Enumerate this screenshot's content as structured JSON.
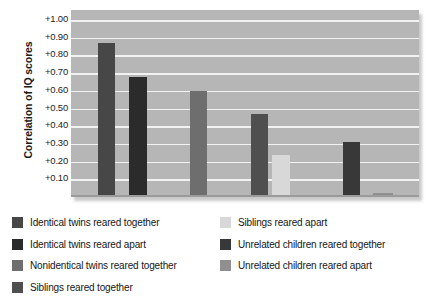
{
  "chart_data": {
    "type": "bar",
    "title": "",
    "xlabel": "",
    "ylabel": "Correlation of IQ scores",
    "ylim": [
      0,
      1.0
    ],
    "grid": true,
    "legend_position": "bottom",
    "ytick_labels": [
      "+1.00",
      "+0.90",
      "+0.80",
      "+0.70",
      "+0.60",
      "+0.50",
      "+0.40",
      "+0.30",
      "+0.20",
      "+0.10"
    ],
    "ytick_values": [
      1.0,
      0.9,
      0.8,
      0.7,
      0.6,
      0.5,
      0.4,
      0.3,
      0.2,
      0.1
    ],
    "categories": [
      "Identical twins reared together",
      "Identical twins reared apart",
      "Nonidentical twins reared together",
      "Siblings reared together",
      "Siblings reared apart",
      "Unrelated children reared together",
      "Unrelated children reared apart"
    ],
    "values": [
      0.87,
      0.68,
      0.6,
      0.47,
      0.24,
      0.31,
      0.02
    ],
    "colors": [
      "#474747",
      "#2b2b2b",
      "#6e6e6e",
      "#4f4f4f",
      "#d8d8d8",
      "#383838",
      "#8f8f8f"
    ]
  },
  "axis": {
    "ylabel": "Correlation of IQ scores",
    "ticks": [
      {
        "label": "+1.00",
        "value": 1.0
      },
      {
        "label": "+0.90",
        "value": 0.9
      },
      {
        "label": "+0.80",
        "value": 0.8
      },
      {
        "label": "+0.70",
        "value": 0.7
      },
      {
        "label": "+0.60",
        "value": 0.6
      },
      {
        "label": "+0.50",
        "value": 0.5
      },
      {
        "label": "+0.40",
        "value": 0.4
      },
      {
        "label": "+0.30",
        "value": 0.3
      },
      {
        "label": "+0.20",
        "value": 0.2
      },
      {
        "label": "+0.10",
        "value": 0.1
      }
    ]
  },
  "legend": {
    "left_column": [
      {
        "label": "Identical twins reared together",
        "color": "#474747"
      },
      {
        "label": "Identical twins reared apart",
        "color": "#2b2b2b"
      },
      {
        "label": "Nonidentical twins reared together",
        "color": "#6e6e6e"
      },
      {
        "label": "Siblings reared together",
        "color": "#4f4f4f"
      }
    ],
    "right_column": [
      {
        "label": "Siblings reared apart",
        "color": "#d8d8d8"
      },
      {
        "label": "Unrelated children reared together",
        "color": "#383838"
      },
      {
        "label": "Unrelated children reared apart",
        "color": "#8f8f8f"
      }
    ]
  },
  "style": {
    "plot_background": "#b6b6b6",
    "gridline_color": "#f2f2f2",
    "page_background": "#ffffff"
  }
}
